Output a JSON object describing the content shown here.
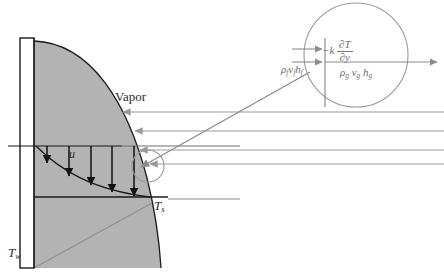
{
  "figure": {
    "type": "film-condensation-schematic",
    "background_color": "#ffffff",
    "film_fill_color": "#b3b3b3",
    "outline_color": "#1a1a1a",
    "vapor_arrow_color": "#9a9a9a",
    "inset_color": "#8c8c8c"
  },
  "labels": {
    "vapor": "Vapor",
    "velocity": "u",
    "wall_temperature": "T",
    "wall_temperature_sub": "w",
    "surface_temperature": "T",
    "surface_temperature_sub": "s"
  },
  "inset": {
    "conduction_term": {
      "prefix": "−k",
      "numerator": "∂T",
      "denominator": "∂y"
    },
    "liquid_enthalpy_flux": {
      "rho": "ρ",
      "rho_sub": "f",
      "v": "v",
      "v_sub": "f",
      "h": "h",
      "h_sub": "f"
    },
    "vapor_enthalpy_flux": {
      "rho": "ρ",
      "rho_sub": "g",
      "v": "v",
      "v_sub": "g",
      "h": "h",
      "h_sub": "g"
    }
  },
  "geometry": {
    "wall": {
      "x": 20,
      "y": 38,
      "w": 14,
      "h": 230
    },
    "film_profile_note": "condensate film thickness grows downward from wall top",
    "vapor_streamlines_count": 4,
    "velocity_arrows_count": 5,
    "inset_circle": {
      "cx": 356,
      "cy": 55,
      "r": 52
    }
  }
}
